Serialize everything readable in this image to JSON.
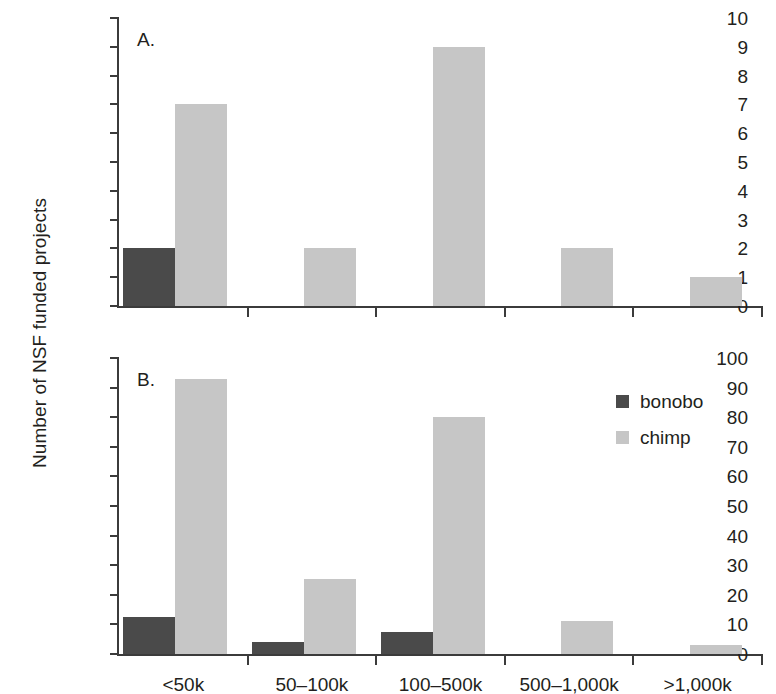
{
  "figure": {
    "ylabel": "Number of NSF funded projects",
    "panel_a_letter": "A.",
    "panel_b_letter": "B."
  },
  "legend": {
    "position": "right-middle",
    "entries": [
      {
        "label": "bonobo",
        "color": "#4a4a4a"
      },
      {
        "label": "chimp",
        "color": "#c6c6c6"
      }
    ]
  },
  "colors": {
    "bonobo": "#4a4a4a",
    "chimp": "#c6c6c6",
    "axis": "#3b3b3b",
    "text": "#231f20",
    "background": "#ffffff"
  },
  "chart_data": [
    {
      "type": "bar",
      "panel": "A.",
      "title": "",
      "xlabel": "",
      "ylabel": "Number of NSF funded projects",
      "categories": [
        "<50k",
        "50–100k",
        "100–500k",
        "500–1,000k",
        ">1,000k"
      ],
      "series": [
        {
          "name": "bonobo",
          "color": "#4a4a4a",
          "values": [
            2,
            0,
            0,
            0,
            0
          ]
        },
        {
          "name": "chimp",
          "color": "#c6c6c6",
          "values": [
            7,
            2,
            9,
            2,
            1
          ]
        }
      ],
      "ylim": [
        0,
        10
      ],
      "yticks": [
        0,
        1,
        2,
        3,
        4,
        5,
        6,
        7,
        8,
        9,
        10
      ],
      "ytick_labels": [
        "0",
        "1",
        "2",
        "3",
        "4",
        "5",
        "6",
        "7",
        "8",
        "9",
        "10"
      ],
      "grid": false,
      "legend": "none"
    },
    {
      "type": "bar",
      "panel": "B.",
      "title": "",
      "xlabel": "",
      "ylabel": "Number of NSF funded projects",
      "categories": [
        "<50k",
        "50–100k",
        "100–500k",
        "500–1,000k",
        ">1,000k"
      ],
      "series": [
        {
          "name": "bonobo",
          "color": "#4a4a4a",
          "values": [
            12.5,
            4,
            7.5,
            0,
            0
          ]
        },
        {
          "name": "chimp",
          "color": "#c6c6c6",
          "values": [
            93,
            25.5,
            80,
            11,
            3
          ]
        }
      ],
      "ylim": [
        0,
        100
      ],
      "yticks": [
        0,
        10,
        20,
        30,
        40,
        50,
        60,
        70,
        80,
        90,
        100
      ],
      "ytick_labels": [
        "0",
        "10",
        "20",
        "30",
        "40",
        "50",
        "60",
        "70",
        "80",
        "90",
        "100"
      ],
      "grid": false,
      "legend": "right"
    }
  ]
}
